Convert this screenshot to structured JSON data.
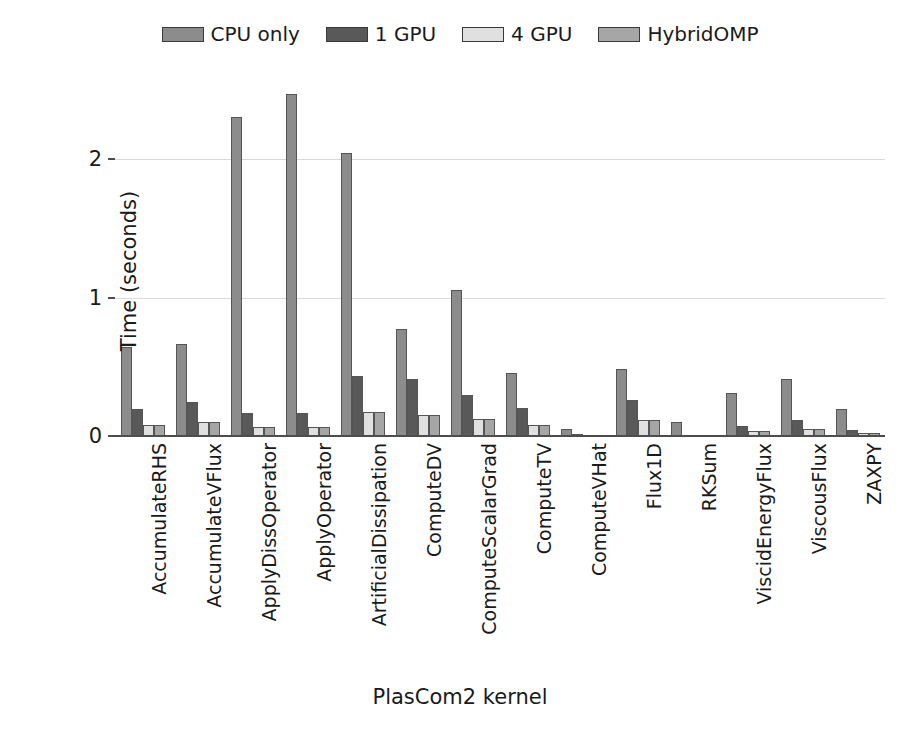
{
  "chart_data": {
    "type": "bar",
    "title": "",
    "xlabel": "PlasCom2 kernel",
    "ylabel": "Time (seconds)",
    "ylim": [
      0,
      2.6
    ],
    "yticks": [
      0,
      1,
      2
    ],
    "ytick_labels": [
      "0",
      "1",
      "2"
    ],
    "grid": "horizontal",
    "legend_position": "top-center",
    "categories": [
      "AccumulateRHS",
      "AccumulateVFlux",
      "ApplyDissOperator",
      "ApplyOperator",
      "ArtificialDissipation",
      "ComputeDV",
      "ComputeScalarGrad",
      "ComputeTV",
      "ComputeVHat",
      "Flux1D",
      "RKSum",
      "ViscidEnergyFlux",
      "ViscousFlux",
      "ZAXPY"
    ],
    "series": [
      {
        "name": "CPU only",
        "color": "#8c8c8c",
        "values": [
          0.65,
          0.67,
          2.31,
          2.48,
          2.05,
          0.78,
          1.06,
          0.46,
          0.06,
          0.49,
          0.11,
          0.32,
          0.42,
          0.2
        ]
      },
      {
        "name": "1 GPU",
        "color": "#595959",
        "values": [
          0.2,
          0.25,
          0.17,
          0.17,
          0.44,
          0.42,
          0.3,
          0.21,
          0.02,
          0.27,
          0.01,
          0.08,
          0.12,
          0.05
        ]
      },
      {
        "name": "4 GPU",
        "color": "#e0e0e0",
        "values": [
          0.09,
          0.11,
          0.07,
          0.07,
          0.18,
          0.16,
          0.13,
          0.09,
          0.01,
          0.12,
          0.01,
          0.04,
          0.06,
          0.03
        ]
      },
      {
        "name": "HybridOMP",
        "color": "#a6a6a6",
        "values": [
          0.09,
          0.11,
          0.07,
          0.07,
          0.18,
          0.16,
          0.13,
          0.09,
          0.01,
          0.12,
          0.01,
          0.04,
          0.06,
          0.03
        ]
      }
    ]
  },
  "legend": {
    "items": [
      {
        "label": "CPU only",
        "color": "#8c8c8c"
      },
      {
        "label": "1 GPU",
        "color": "#595959"
      },
      {
        "label": "4 GPU",
        "color": "#e0e0e0"
      },
      {
        "label": "HybridOMP",
        "color": "#a6a6a6"
      }
    ]
  },
  "axes": {
    "y_title": "Time (seconds)",
    "x_title": "PlasCom2 kernel"
  }
}
